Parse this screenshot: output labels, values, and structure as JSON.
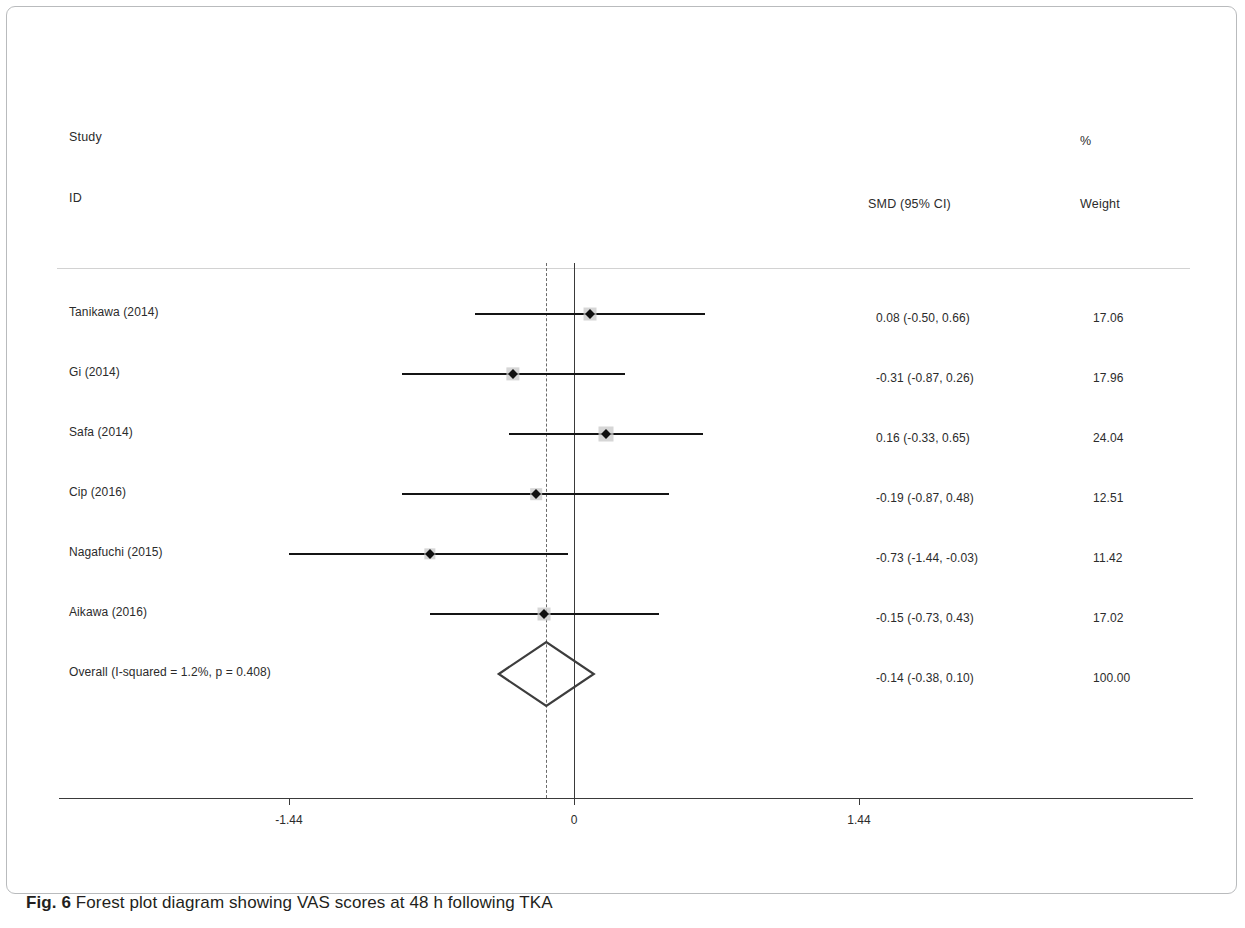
{
  "figure": {
    "caption_prefix": "Fig. 6",
    "caption_text": "Forest plot diagram showing VAS scores at 48 h following TKA"
  },
  "header": {
    "study_line1": "Study",
    "study_line2": "ID",
    "effect_header": "SMD (95% CI)",
    "weight_percent_symbol": "%",
    "weight_header": "Weight"
  },
  "chart_data": {
    "type": "forest",
    "title": "Forest plot diagram showing VAS scores at 48 h following TKA",
    "xlabel": "",
    "ylabel": "",
    "effect_measure": "SMD (95% CI)",
    "xlim": [
      -1.8,
      1.8
    ],
    "xticks": [
      -1.44,
      0,
      1.44
    ],
    "xtick_labels": [
      "-1.44",
      "0",
      "1.44"
    ],
    "null_line": 0,
    "pooled_line": -0.14,
    "grid": false,
    "legend": "none",
    "heterogeneity": {
      "i_squared_percent": 1.2,
      "p_value": 0.408,
      "text": "Overall  (I-squared = 1.2%, p = 0.408)"
    },
    "studies": [
      {
        "label": "Tanikawa  (2014)",
        "effect": 0.08,
        "ci_low": -0.5,
        "ci_high": 0.66,
        "weight": 17.06,
        "effect_text": "0.08 (-0.50, 0.66)",
        "weight_text": "17.06"
      },
      {
        "label": "Gi (2014)",
        "effect": -0.31,
        "ci_low": -0.87,
        "ci_high": 0.26,
        "weight": 17.96,
        "effect_text": "-0.31 (-0.87, 0.26)",
        "weight_text": "17.96"
      },
      {
        "label": "Safa (2014)",
        "effect": 0.16,
        "ci_low": -0.33,
        "ci_high": 0.65,
        "weight": 24.04,
        "effect_text": "0.16 (-0.33, 0.65)",
        "weight_text": "24.04"
      },
      {
        "label": "Cip  (2016)",
        "effect": -0.19,
        "ci_low": -0.87,
        "ci_high": 0.48,
        "weight": 12.51,
        "effect_text": "-0.19 (-0.87, 0.48)",
        "weight_text": "12.51"
      },
      {
        "label": "Nagafuchi  (2015)",
        "effect": -0.73,
        "ci_low": -1.44,
        "ci_high": -0.03,
        "weight": 11.42,
        "effect_text": "-0.73 (-1.44, -0.03)",
        "weight_text": "11.42"
      },
      {
        "label": "Aikawa (2016)",
        "effect": -0.15,
        "ci_low": -0.73,
        "ci_high": 0.43,
        "weight": 17.02,
        "effect_text": "-0.15 (-0.73, 0.43)",
        "weight_text": "17.02"
      }
    ],
    "overall": {
      "label": "Overall  (I-squared = 1.2%, p = 0.408)",
      "effect": -0.14,
      "ci_low": -0.38,
      "ci_high": 0.1,
      "weight": 100.0,
      "effect_text": "-0.14 (-0.38, 0.10)",
      "weight_text": "100.00"
    }
  },
  "colors": {
    "marker": "#111111",
    "ci_line": "#141414",
    "zero_line": "#3a3a3a",
    "pooled_line": "#6b6b6b",
    "header_rule": "#d2d2d2",
    "frame": "#b9bbbd"
  }
}
